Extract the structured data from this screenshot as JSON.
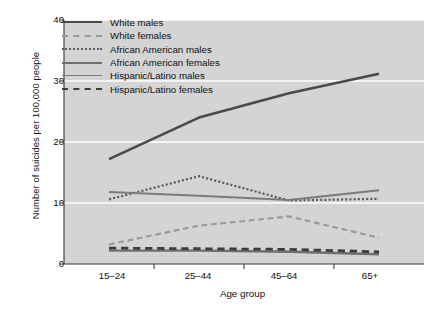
{
  "chart_data": {
    "type": "line",
    "title": "",
    "xlabel": "Age group",
    "ylabel": "Number of suicides per 100,000 people",
    "categories": [
      "15–24",
      "25–44",
      "45–64",
      "65+"
    ],
    "ylim": [
      0,
      40
    ],
    "yticks": [
      0,
      10,
      20,
      30,
      40
    ],
    "grid": "horizontal-white-gridlines",
    "legend_position": "upper-left-inside",
    "plot_background": "#d4d4d4",
    "series": [
      {
        "name": "White males",
        "values": [
          17.2,
          24.0,
          28.0,
          31.2
        ],
        "style": "solid",
        "width": 2.6,
        "color": "#4a4a4a"
      },
      {
        "name": "White females",
        "values": [
          3.2,
          6.3,
          7.8,
          4.3
        ],
        "style": "dashed",
        "width": 2.2,
        "color": "#9a9a9a"
      },
      {
        "name": "African American males",
        "values": [
          10.6,
          14.4,
          10.4,
          10.7
        ],
        "style": "dotted",
        "width": 2.2,
        "color": "#5a5a5a"
      },
      {
        "name": "African American females",
        "values": [
          2.2,
          2.2,
          2.0,
          1.6
        ],
        "style": "solid",
        "width": 2.4,
        "color": "#6f6f6f"
      },
      {
        "name": "Hispanic/Latino males",
        "values": [
          11.8,
          11.2,
          10.5,
          12.1
        ],
        "style": "solid",
        "width": 1.9,
        "color": "#7a7a7a"
      },
      {
        "name": "Hispanic/Latino females",
        "values": [
          2.6,
          2.5,
          2.4,
          2.0
        ],
        "style": "dashed",
        "width": 2.8,
        "color": "#3d3d3d"
      }
    ]
  },
  "legend": {
    "items": [
      {
        "label": "White males"
      },
      {
        "label": "White females"
      },
      {
        "label": "African American males"
      },
      {
        "label": "African American females"
      },
      {
        "label": "Hispanic/Latino males"
      },
      {
        "label": "Hispanic/Latino females"
      }
    ]
  },
  "axes": {
    "y_title": "Number of suicides per 100,000 people",
    "x_title": "Age group",
    "y_tick_labels": [
      "40",
      "30",
      "20",
      "10",
      "0"
    ],
    "x_tick_labels": [
      "15–24",
      "25–44",
      "45–64",
      "65+"
    ]
  }
}
